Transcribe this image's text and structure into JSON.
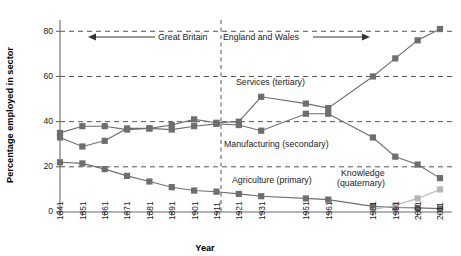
{
  "chart_data": {
    "type": "line",
    "title": "",
    "xlabel": "Year",
    "ylabel": "Percentage employed in sector",
    "x": [
      "1841",
      "1851",
      "1861",
      "1871",
      "1881",
      "1891",
      "1901",
      "1911",
      "1921",
      "1931",
      "1951",
      "1961",
      "1981",
      "1991",
      "2001",
      "2011"
    ],
    "ylim": [
      0,
      85
    ],
    "xlim_note": "even spacing per census tick",
    "yticks": [
      0,
      20,
      40,
      60,
      80
    ],
    "grid": "horizontal dashed at 20, 40, 60, 80",
    "legend": "inline labels next to series",
    "series": [
      {
        "name": "Services (tertiary)",
        "color": "#6e6e6e",
        "marker": "square",
        "values": [
          35,
          38,
          38,
          36.5,
          37,
          38.5,
          41,
          39.5,
          40,
          51,
          48,
          46,
          60,
          68,
          76,
          81
        ]
      },
      {
        "name": "Manufacturing (secondary)",
        "color": "#6e6e6e",
        "marker": "square",
        "values": [
          33,
          29,
          31.5,
          37,
          37,
          36.5,
          38,
          39,
          38.5,
          36,
          43.5,
          43.5,
          33,
          24.5,
          21,
          15
        ]
      },
      {
        "name": "Agriculture (primary)",
        "color": "#6e6e6e",
        "marker": "square",
        "values": [
          22,
          21.5,
          19,
          16,
          13.5,
          11,
          9.5,
          9,
          8,
          7,
          6,
          5.5,
          2.5,
          2,
          1.8,
          1.5
        ]
      },
      {
        "name": "Knowledge (quaternary)",
        "color": "#b5b5b5",
        "marker": "square",
        "values": [
          null,
          null,
          null,
          null,
          null,
          null,
          null,
          null,
          null,
          null,
          null,
          null,
          1,
          3,
          6,
          10
        ]
      }
    ],
    "annotations": [
      {
        "name": "great-britain-span",
        "text": "Great Britain",
        "note": "left arrow, covers 1841-1911"
      },
      {
        "name": "england-wales-span",
        "text": "England and Wales",
        "note": "right arrow, covers 1921-2011"
      },
      {
        "name": "services-label",
        "text": "Services (tertiary)"
      },
      {
        "name": "manufacturing-label",
        "text": "Manufacturing (secondary)"
      },
      {
        "name": "agriculture-label",
        "text": "Agriculture (primary)"
      },
      {
        "name": "knowledge-label-line1",
        "text": "Knowledge"
      },
      {
        "name": "knowledge-label-line2",
        "text": "(quaternary)"
      }
    ],
    "divider_after": "1911"
  },
  "axis": {
    "ylabel": "Percentage employed in sector",
    "xlabel": "Year",
    "ytick_labels": [
      "0",
      "20",
      "40",
      "60",
      "80"
    ],
    "xtick_labels": [
      "1841",
      "1851",
      "1861",
      "1871",
      "1881",
      "1891",
      "1901",
      "1911",
      "1921",
      "1931",
      "1951",
      "1961",
      "1981",
      "1991",
      "2001",
      "2011"
    ]
  },
  "colors": {
    "primary_series": "#6e6e6e",
    "knowledge_series": "#b5b5b5",
    "grid": "#555555",
    "axis": "#6b6b6b",
    "text": "#1a1a1a",
    "background": "#ffffff"
  }
}
